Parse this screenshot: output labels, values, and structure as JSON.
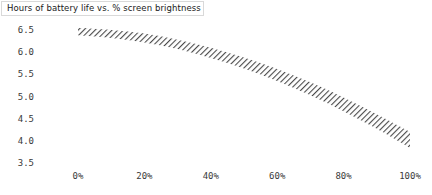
{
  "chart_data": {
    "type": "area",
    "title": "Hours of battery life vs. % screen brightness",
    "xlabel": "",
    "ylabel": "",
    "grid": false,
    "legend": "none",
    "style": "hatched uncertainty band, diagonal line fill",
    "band_fill": "#555555",
    "xlim": [
      0,
      100
    ],
    "ylim": [
      3.5,
      6.5
    ],
    "x_tick_labels": [
      "0%",
      "20%",
      "40%",
      "60%",
      "80%",
      "100%"
    ],
    "x_tick_values": [
      0,
      20,
      40,
      60,
      80,
      100
    ],
    "y_tick_labels": [
      "6.5",
      "6.0",
      "5.5",
      "5.0",
      "4.5",
      "4.0",
      "3.5"
    ],
    "y_tick_values": [
      6.5,
      6.0,
      5.5,
      5.0,
      4.5,
      4.0,
      3.5
    ],
    "x": [
      0,
      10,
      20,
      30,
      40,
      50,
      60,
      70,
      80,
      90,
      100
    ],
    "series": [
      {
        "name": "upper bound",
        "values": [
          6.55,
          6.5,
          6.42,
          6.28,
          6.1,
          5.88,
          5.62,
          5.32,
          4.98,
          4.6,
          4.2
        ]
      },
      {
        "name": "lower bound",
        "values": [
          6.38,
          6.32,
          6.22,
          6.07,
          5.87,
          5.63,
          5.35,
          5.03,
          4.67,
          4.27,
          3.84
        ]
      },
      {
        "name": "battery life (hours)",
        "values": [
          6.46,
          6.41,
          6.32,
          6.17,
          5.98,
          5.75,
          5.48,
          5.17,
          4.82,
          4.43,
          4.02
        ]
      }
    ]
  }
}
